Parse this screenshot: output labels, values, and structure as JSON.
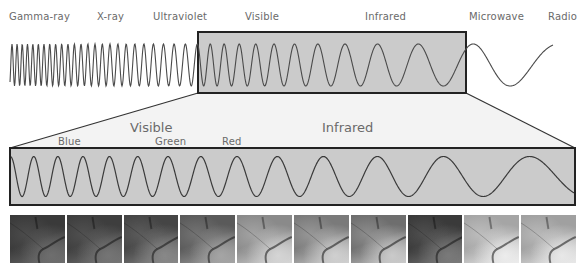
{
  "spectrum": {
    "bands": [
      {
        "label": "Gamma-ray",
        "x": 9
      },
      {
        "label": "X-ray",
        "x": 97
      },
      {
        "label": "Ultraviolet",
        "x": 153
      },
      {
        "label": "Visible",
        "x": 245
      },
      {
        "label": "Infrared",
        "x": 365
      },
      {
        "label": "Microwave",
        "x": 469
      },
      {
        "label": "Radio",
        "x": 548
      }
    ]
  },
  "detail": {
    "region_labels": [
      {
        "label": "Visible",
        "x": 130,
        "y": 120
      },
      {
        "label": "Infrared",
        "x": 322,
        "y": 120
      }
    ],
    "color_labels": [
      {
        "label": "Blue",
        "x": 58,
        "y": 136
      },
      {
        "label": "Green",
        "x": 155,
        "y": 136
      },
      {
        "label": "Red",
        "x": 222,
        "y": 136
      }
    ]
  },
  "colors": {
    "wave": "#4a4a4a",
    "box_fill": "#c9c9c9",
    "box_stroke": "#222222",
    "zoom_fill": "#f2f2f2",
    "label": "#6a6a6a"
  },
  "thumbnails": {
    "count": 10,
    "bands": [
      {
        "name": "band-1",
        "tone": "#3a3a3a",
        "light": "#6e6e6e"
      },
      {
        "name": "band-2",
        "tone": "#3e3e3e",
        "light": "#757575"
      },
      {
        "name": "band-3",
        "tone": "#454545",
        "light": "#888888"
      },
      {
        "name": "band-4",
        "tone": "#5a5a5a",
        "light": "#a5a5a5"
      },
      {
        "name": "band-5",
        "tone": "#8a8a8a",
        "light": "#d5d5d5"
      },
      {
        "name": "band-6",
        "tone": "#7a7a7a",
        "light": "#d0d0d0"
      },
      {
        "name": "band-7",
        "tone": "#6e6e6e",
        "light": "#cacaca"
      },
      {
        "name": "band-8",
        "tone": "#3a3a3a",
        "light": "#7a7a7a"
      },
      {
        "name": "band-9",
        "tone": "#a5a5a5",
        "light": "#ececec"
      },
      {
        "name": "band-10",
        "tone": "#a0a0a0",
        "light": "#e8e8e8"
      }
    ]
  }
}
